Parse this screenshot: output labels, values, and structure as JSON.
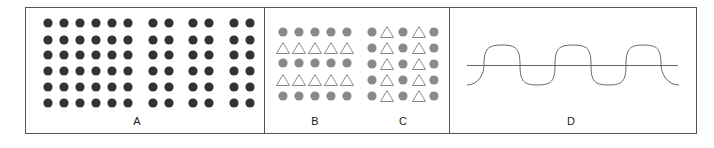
{
  "figure": {
    "frame": {
      "x": 25,
      "y": 7,
      "width": 671,
      "height": 126,
      "stroke": "#555555"
    },
    "dividers": [
      264,
      449
    ],
    "colors": {
      "dark_dot": "#333333",
      "gray_dot": "#8a8a8a",
      "triangle_stroke": "#8a8a8a",
      "line": "#666666"
    },
    "panels": [
      {
        "id": "A",
        "label": "A",
        "label_pos": [
          137,
          125
        ],
        "description": "Grid of dark dots: group of 6 columns followed by 3 pairs of columns, 6 rows",
        "columns_x": [
          48,
          64,
          80,
          96,
          112,
          128,
          153,
          169,
          193,
          209,
          234,
          250
        ],
        "rows_y": [
          23,
          40,
          55,
          71,
          87,
          103
        ]
      },
      {
        "id": "B",
        "label": "B",
        "label_pos": [
          315,
          125
        ],
        "description": "Alternating rows of gray dots and open triangles",
        "columns_x": [
          283,
          299,
          315,
          331,
          347
        ],
        "rows": [
          {
            "y": 32,
            "shape": "dot"
          },
          {
            "y": 48,
            "shape": "triangle"
          },
          {
            "y": 63,
            "shape": "dot"
          },
          {
            "y": 80,
            "shape": "triangle"
          },
          {
            "y": 96,
            "shape": "dot"
          }
        ]
      },
      {
        "id": "C",
        "label": "C",
        "label_pos": [
          403,
          125
        ],
        "description": "Alternating columns of gray dots and open triangles",
        "columns": [
          {
            "x": 372,
            "shape": "dot"
          },
          {
            "x": 387,
            "shape": "triangle"
          },
          {
            "x": 403,
            "shape": "dot"
          },
          {
            "x": 419,
            "shape": "triangle"
          },
          {
            "x": 434,
            "shape": "dot"
          }
        ],
        "rows_y": [
          32,
          48,
          64,
          80,
          96
        ]
      },
      {
        "id": "D",
        "label": "D",
        "label_pos": [
          571,
          125
        ],
        "description": "Horizontal line crossed by a wavy curve of semicircular arcs",
        "line": {
          "x1": 467,
          "x2": 678,
          "y": 65
        },
        "wave": {
          "start_x": 467,
          "crossings_x": [
            484,
            520,
            555,
            591,
            626,
            661
          ],
          "end_x": 679,
          "crest_y": 45,
          "trough_y": 85
        }
      }
    ]
  }
}
